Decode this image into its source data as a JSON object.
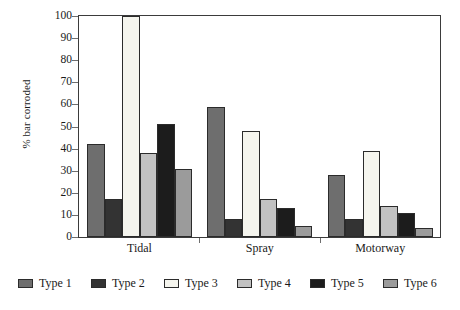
{
  "chart_data": {
    "type": "bar",
    "title": "",
    "subtitle": "",
    "xlabel": "",
    "ylabel": "% bar corroded",
    "categories": [
      "Tidal",
      "Spray",
      "Motorway"
    ],
    "ylim": [
      0,
      100
    ],
    "y_ticks": [
      0,
      10,
      20,
      30,
      40,
      50,
      60,
      70,
      80,
      90,
      100
    ],
    "grid": false,
    "legend_position": "bottom",
    "series": [
      {
        "name": "Type 1",
        "color": "#6e6e6e",
        "values": [
          42,
          59,
          28
        ]
      },
      {
        "name": "Type 2",
        "color": "#333333",
        "values": [
          17,
          8,
          8
        ]
      },
      {
        "name": "Type 3",
        "color": "#f5f5ee",
        "values": [
          100,
          48,
          39
        ]
      },
      {
        "name": "Type 4",
        "color": "#c2c2c2",
        "values": [
          38,
          17,
          14
        ]
      },
      {
        "name": "Type 5",
        "color": "#1c1c1c",
        "values": [
          51,
          13,
          11
        ]
      },
      {
        "name": "Type 6",
        "color": "#9b9b9b",
        "values": [
          31,
          5,
          4
        ]
      }
    ]
  },
  "axis": {
    "y_title": "% bar corroded",
    "y_tick_labels": [
      "0",
      "10",
      "20",
      "30",
      "40",
      "50",
      "60",
      "70",
      "80",
      "90",
      "100"
    ],
    "x_tick_labels": [
      "Tidal",
      "Spray",
      "Motorway"
    ]
  },
  "legend": {
    "items": [
      {
        "label": "Type 1",
        "swatch": "#6e6e6e"
      },
      {
        "label": "Type 2",
        "swatch": "#333333"
      },
      {
        "label": "Type 3",
        "swatch": "#f5f5ee"
      },
      {
        "label": "Type 4",
        "swatch": "#c2c2c2"
      },
      {
        "label": "Type 5",
        "swatch": "#1c1c1c"
      },
      {
        "label": "Type 6",
        "swatch": "#9b9b9b"
      }
    ]
  }
}
